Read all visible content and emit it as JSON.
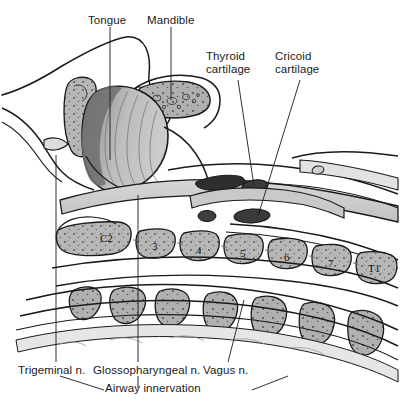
{
  "figure": {
    "background_color": "#ffffff",
    "line_color": "#1a1a1a",
    "text_color": "#1a1a1a"
  },
  "labels": {
    "tongue": "Tongue",
    "mandible": "Mandible",
    "thyroid_line1": "Thyroid",
    "thyroid_line2": "cartilage",
    "cricoid_line1": "Cricoid",
    "cricoid_line2": "cartilage",
    "trigeminal": "Trigeminal n.",
    "glossopharyngeal": "Glossopharyngeal n.",
    "vagus": "Vagus n.",
    "airway_innervation": "Airway innervation"
  },
  "vertebrae": [
    {
      "id": "c2",
      "label": "C2"
    },
    {
      "id": "c3",
      "label": "3"
    },
    {
      "id": "c4",
      "label": "4"
    },
    {
      "id": "c5",
      "label": "5"
    },
    {
      "id": "c6",
      "label": "6"
    },
    {
      "id": "c7",
      "label": "7"
    },
    {
      "id": "t1",
      "label": "T1"
    }
  ],
  "structures": {
    "tongue_fill": "#b5b5b5",
    "tongue_dark_fill": "#6e6e6e",
    "bone_fill": "#b9b9b9",
    "soft_tissue_fill": "#cfcfcf",
    "cartilage_fill": "#3a3a3a",
    "palate_fill": "#c4c4c4"
  }
}
